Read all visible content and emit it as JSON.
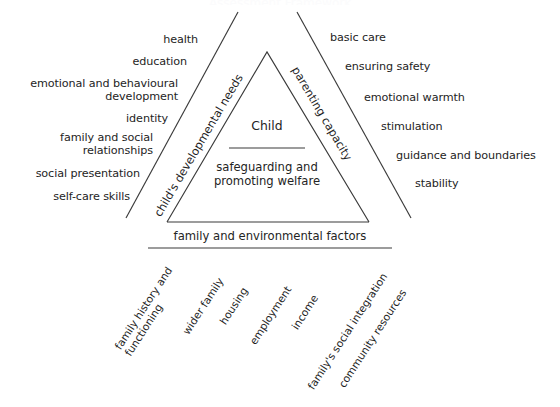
{
  "figure": {
    "ghost_title": "Assessment Framework",
    "centre": {
      "child_label": "Child",
      "safeguard_label": "safeguarding and\npromoting welfare"
    },
    "legs": {
      "left_label": "child's developmental needs",
      "right_label": "parenting capacity",
      "base_label": "family and environmental factors"
    },
    "developmental_needs": [
      "health",
      "education",
      "emotional and behavioural\ndevelopment",
      "identity",
      "family and social\nrelationships",
      "social presentation",
      "self-care skills"
    ],
    "parenting_capacity": [
      "basic care",
      "ensuring safety",
      "emotional warmth",
      "stimulation",
      "guidance and boundaries",
      "stability"
    ],
    "environmental_factors": [
      "family history and\nfunctioning",
      "wider family",
      "housing",
      "employment",
      "income",
      "family's social integration",
      "community resources"
    ],
    "colors": {
      "line": "#3a3a3a",
      "text": "#242424",
      "background": "#ffffff"
    }
  }
}
